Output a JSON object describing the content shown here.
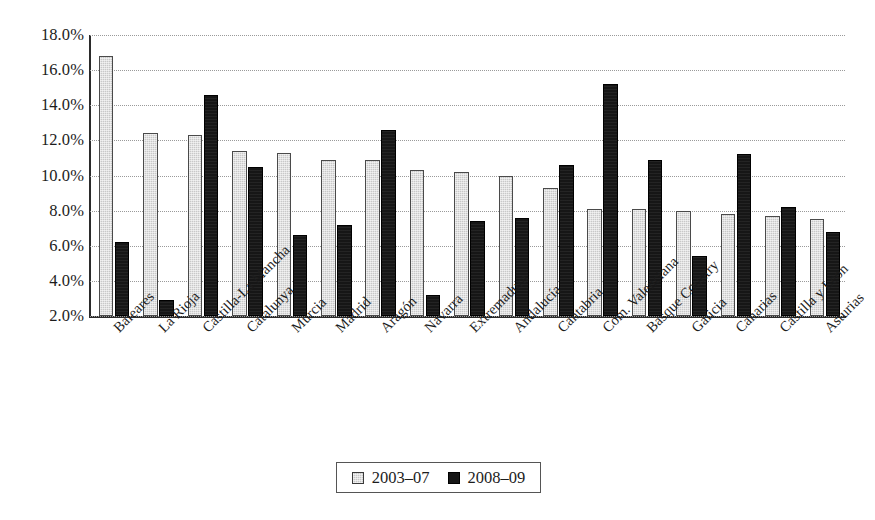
{
  "chart_data": {
    "type": "bar",
    "title": "",
    "subtitle": "",
    "xlabel": "",
    "ylabel": "",
    "ylim": [
      2.0,
      18.0
    ],
    "ytick_step": 2.0,
    "ytick_labels": [
      "18.0%",
      "16.0%",
      "14.0%",
      "12.0%",
      "10.0%",
      "8.0%",
      "6.0%",
      "4.0%",
      "2.0%"
    ],
    "ytick_values": [
      18.0,
      16.0,
      14.0,
      12.0,
      10.0,
      8.0,
      6.0,
      4.0,
      2.0
    ],
    "grid": true,
    "grid_style": "dotted",
    "legend_position": "bottom-center",
    "value_unit": "%",
    "categories": [
      "Baleares",
      "La Rioja",
      "Castilla-La Mancha",
      "Catalunya",
      "Murcia",
      "Madrid",
      "Aragón",
      "Navarra",
      "Extremadura",
      "Andalucía",
      "Cantabria",
      "Com. Valenciana",
      "Basque Country",
      "Galicia",
      "Canarias",
      "Castilla y Leon",
      "Asturias"
    ],
    "series": [
      {
        "name": "2003–07",
        "color": "#c8c8c8",
        "values": [
          16.8,
          12.4,
          12.3,
          11.4,
          11.3,
          10.9,
          10.9,
          10.3,
          10.2,
          10.0,
          9.3,
          8.1,
          8.1,
          8.0,
          7.8,
          7.7,
          7.5
        ]
      },
      {
        "name": "2008–09",
        "color": "#161616",
        "values": [
          6.2,
          2.9,
          14.6,
          10.5,
          6.6,
          7.2,
          12.6,
          3.2,
          7.4,
          7.6,
          10.6,
          15.2,
          10.9,
          5.4,
          11.2,
          8.2,
          6.8
        ]
      }
    ]
  },
  "legend": {
    "items": [
      {
        "label": "2003–07",
        "swatch": "light-gray-hatched"
      },
      {
        "label": "2008–09",
        "swatch": "solid-black"
      }
    ]
  }
}
